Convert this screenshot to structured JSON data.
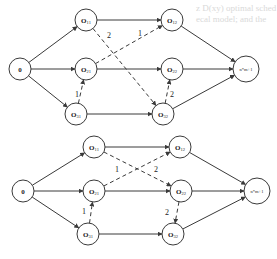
{
  "background_text": [
    {
      "text": "z D(xy) optimal sched",
      "x": 196,
      "y": 3
    },
    {
      "text": "ecal model; and the",
      "x": 196,
      "y": 14
    },
    {
      "text": "",
      "x": 0,
      "y": 0
    }
  ],
  "diagrams": [
    {
      "id": "top",
      "nodes": [
        {
          "id": "source",
          "label": "0",
          "sub": "",
          "x": 20,
          "y": 69
        },
        {
          "id": "O11",
          "label": "O",
          "sub": "11",
          "x": 86,
          "y": 20
        },
        {
          "id": "O12",
          "label": "O",
          "sub": "12",
          "x": 172,
          "y": 20
        },
        {
          "id": "O21",
          "label": "O",
          "sub": "21",
          "x": 86,
          "y": 69
        },
        {
          "id": "O22",
          "label": "O",
          "sub": "22",
          "x": 172,
          "y": 69
        },
        {
          "id": "O31",
          "label": "O",
          "sub": "31",
          "x": 76,
          "y": 114
        },
        {
          "id": "O32",
          "label": "O",
          "sub": "32",
          "x": 163,
          "y": 114
        },
        {
          "id": "sink",
          "label": "n*m+1",
          "sub": "",
          "x": 246,
          "y": 69
        }
      ],
      "conjunctive_arcs": [
        [
          "source",
          "O11"
        ],
        [
          "source",
          "O21"
        ],
        [
          "source",
          "O31"
        ],
        [
          "O11",
          "O12"
        ],
        [
          "O21",
          "O22"
        ],
        [
          "O31",
          "O32"
        ],
        [
          "O12",
          "sink"
        ],
        [
          "O22",
          "sink"
        ],
        [
          "O32",
          "sink"
        ]
      ],
      "disjunctive_arcs": [
        {
          "from": "O11",
          "to": "O32",
          "weight": "2",
          "wx": 107,
          "wy": 38
        },
        {
          "from": "O21",
          "to": "O12",
          "weight": "1",
          "wx": 138,
          "wy": 36
        },
        {
          "from": "O31",
          "to": "O21",
          "weight": "1",
          "wx": 75,
          "wy": 97
        },
        {
          "from": "O32",
          "to": "O22",
          "weight": "2",
          "wx": 170,
          "wy": 97
        }
      ]
    },
    {
      "id": "bottom",
      "nodes": [
        {
          "id": "source",
          "label": "0",
          "sub": "",
          "x": 23,
          "y": 191
        },
        {
          "id": "O11",
          "label": "O",
          "sub": "11",
          "x": 94,
          "y": 147
        },
        {
          "id": "O12",
          "label": "O",
          "sub": "12",
          "x": 180,
          "y": 147
        },
        {
          "id": "O21",
          "label": "O",
          "sub": "21",
          "x": 94,
          "y": 191
        },
        {
          "id": "O22",
          "label": "O",
          "sub": "22",
          "x": 181,
          "y": 191
        },
        {
          "id": "O31",
          "label": "O",
          "sub": "31",
          "x": 88,
          "y": 234
        },
        {
          "id": "O32",
          "label": "O",
          "sub": "32",
          "x": 173,
          "y": 234
        },
        {
          "id": "sink",
          "label": "n*m+1",
          "sub": "",
          "x": 257,
          "y": 191
        }
      ],
      "conjunctive_arcs": [
        [
          "source",
          "O11"
        ],
        [
          "source",
          "O21"
        ],
        [
          "source",
          "O31"
        ],
        [
          "O11",
          "O12"
        ],
        [
          "O21",
          "O22"
        ],
        [
          "O31",
          "O32"
        ],
        [
          "O12",
          "sink"
        ],
        [
          "O22",
          "sink"
        ],
        [
          "O32",
          "sink"
        ]
      ],
      "disjunctive_arcs": [
        {
          "from": "O11",
          "to": "O22",
          "weight": "2",
          "wx": 154,
          "wy": 172
        },
        {
          "from": "O21",
          "to": "O12",
          "weight": "1",
          "wx": 115,
          "wy": 172
        },
        {
          "from": "O31",
          "to": "O21",
          "weight": "1",
          "wx": 82,
          "wy": 214
        },
        {
          "from": "O22",
          "to": "O32",
          "weight": "2",
          "wx": 165,
          "wy": 215
        }
      ]
    }
  ]
}
